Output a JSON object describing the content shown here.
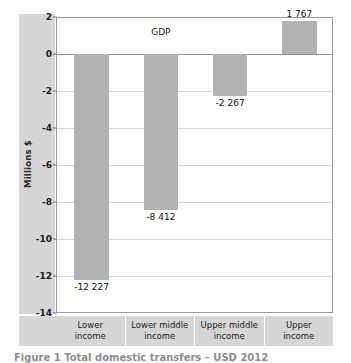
{
  "chart_data": {
    "type": "bar",
    "title": "",
    "xlabel": "",
    "ylabel": "Millions $",
    "categories": [
      "Lower\nincome",
      "Lower middle\nincome",
      "Upper middle\nincome",
      "Upper\nincome"
    ],
    "category_lines": [
      [
        "Lower",
        "income"
      ],
      [
        "Lower middle",
        "income"
      ],
      [
        "Upper middle",
        "income"
      ],
      [
        "Upper",
        "income"
      ]
    ],
    "series": [
      {
        "name": "GDP",
        "values": [
          -12227,
          -8412,
          -2267,
          1767
        ],
        "value_labels": [
          "-12 227",
          "-8 412",
          "-2 267",
          "1 767"
        ],
        "axis_values": [
          -12.227,
          -8.412,
          -2.267,
          1.767
        ]
      }
    ],
    "series_annotation": "GDP",
    "ylim": [
      -14,
      2
    ],
    "yticks": [
      2,
      0,
      -2,
      -4,
      -6,
      -8,
      -10,
      -12,
      -14
    ],
    "ytick_labels": [
      "2",
      "0",
      "-2",
      "-4",
      "-6",
      "-8",
      "-10",
      "-12",
      "-14"
    ],
    "grid": "horizontal",
    "legend": "none",
    "bar_color": "#b3b3b3",
    "axis_band_color": "#d6d6d6",
    "gridline_color": "#d8d8d8",
    "plot_border_color": "#9a9a9a"
  },
  "caption": {
    "text": "Figure 1 Total domestic transfers – USD 2012"
  }
}
